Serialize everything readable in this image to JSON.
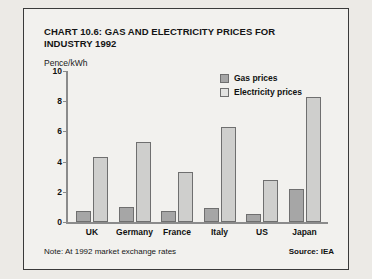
{
  "card": {
    "title": "CHART 10.6: GAS AND ELECTRICITY PRICES FOR INDUSTRY 1992",
    "unit_label": "Pence/kWh",
    "note": "Note: At 1992 market exchange rates",
    "source": "Source: IEA"
  },
  "legend": {
    "gas_label": "Gas prices",
    "electricity_label": "Electricity prices",
    "gas_color": "#a6a6a6",
    "electricity_color": "#cfcfcd"
  },
  "chart_data": {
    "type": "bar",
    "title": "CHART 10.6: GAS AND ELECTRICITY PRICES FOR INDUSTRY 1992",
    "subtitle": "Pence/kWh",
    "xlabel": "",
    "ylabel": "Pence/kWh",
    "ylim": [
      0,
      10
    ],
    "yticks": [
      0,
      2,
      4,
      6,
      8,
      10
    ],
    "ytick_labels": [
      "0",
      "2",
      "4",
      "6",
      "8",
      "10"
    ],
    "grid": false,
    "legend_position": "top-right",
    "categories": [
      "UK",
      "Germany",
      "France",
      "Italy",
      "US",
      "Japan"
    ],
    "series": [
      {
        "name": "Gas prices",
        "color": "#a6a6a6",
        "values": [
          0.75,
          1.0,
          0.7,
          0.9,
          0.5,
          2.2
        ]
      },
      {
        "name": "Electricity prices",
        "color": "#cfcfcd",
        "values": [
          4.3,
          5.3,
          3.3,
          6.3,
          2.75,
          8.3
        ]
      }
    ],
    "annotations": [
      "Note: At 1992 market exchange rates",
      "Source: IEA"
    ]
  }
}
